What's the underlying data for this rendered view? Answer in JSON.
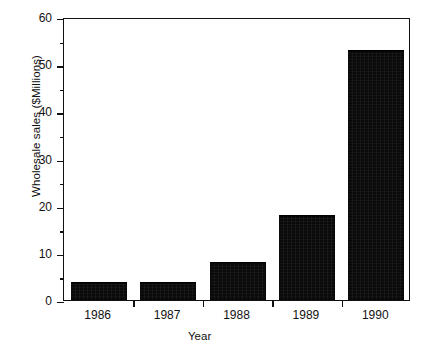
{
  "chart_data": {
    "type": "bar",
    "title": "",
    "subtitle": "",
    "xlabel": "Year",
    "ylabel": "Wholesale sales ($Millions)",
    "categories": [
      "1986",
      "1987",
      "1988",
      "1989",
      "1990"
    ],
    "values": [
      3.7,
      3.7,
      7.8,
      17.8,
      52.8
    ],
    "series": [
      {
        "name": "Wholesale sales",
        "values": [
          3.7,
          3.7,
          7.8,
          17.8,
          52.8
        ]
      }
    ],
    "ylim": [
      0,
      60
    ],
    "xlim": null,
    "y_major_ticks": [
      0,
      10,
      20,
      30,
      40,
      50,
      60
    ],
    "y_minor_ticks": [
      5,
      15,
      25,
      35,
      45,
      55
    ],
    "y_tick_labels": [
      "0",
      "10",
      "20",
      "30",
      "40",
      "50",
      "60"
    ],
    "grid": false,
    "legend": false,
    "legend_position": "none",
    "bar_color": "#0a0a0a",
    "axis_color": "#111111",
    "background_color": "#ffffff",
    "annotations": []
  }
}
